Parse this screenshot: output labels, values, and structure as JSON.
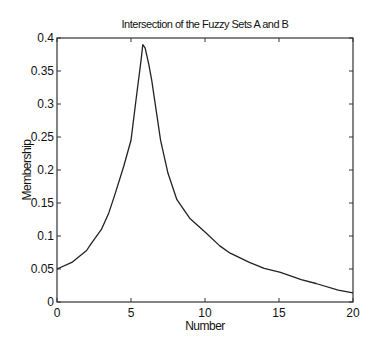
{
  "chart_data": {
    "type": "line",
    "title": "Intersection of the Fuzzy Sets A and B",
    "xlabel": "Number",
    "ylabel": "Membership",
    "xlim": [
      0,
      20
    ],
    "ylim": [
      0,
      0.4
    ],
    "grid": false,
    "box": true,
    "legend": null,
    "x_ticks": [
      0,
      5,
      10,
      15,
      20
    ],
    "x_tick_labels": [
      "0",
      "5",
      "10",
      "15",
      "20"
    ],
    "y_ticks": [
      0,
      0.05,
      0.1,
      0.15,
      0.2,
      0.25,
      0.3,
      0.35,
      0.4
    ],
    "y_tick_labels": [
      "0",
      "0.05",
      "0.1",
      "0.15",
      "0.2",
      "0.25",
      "0.3",
      "0.35",
      "0.4"
    ],
    "series": [
      {
        "name": "A ∩ B",
        "color": "#222222",
        "x": [
          0,
          1,
          2,
          2.3,
          3,
          3.5,
          3.9,
          4.5,
          5.0,
          5.34,
          5.68,
          5.8,
          5.95,
          6.2,
          6.4,
          7.0,
          7.5,
          8.1,
          9,
          10,
          11,
          11.7,
          13,
          14,
          15.1,
          16.5,
          17.5,
          19,
          20
        ],
        "y": [
          0.05,
          0.06,
          0.078,
          0.088,
          0.11,
          0.135,
          0.162,
          0.205,
          0.245,
          0.306,
          0.367,
          0.39,
          0.385,
          0.36,
          0.336,
          0.245,
          0.195,
          0.155,
          0.126,
          0.106,
          0.085,
          0.074,
          0.06,
          0.051,
          0.045,
          0.034,
          0.028,
          0.018,
          0.014
        ]
      }
    ]
  },
  "layout": {
    "plot_left": 57,
    "plot_right": 353,
    "plot_top": 38,
    "plot_bottom": 302
  }
}
